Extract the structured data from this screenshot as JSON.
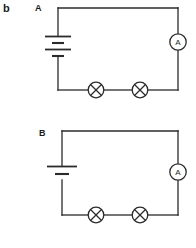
{
  "figure": {
    "panel_letter": "b",
    "width": 196,
    "height": 248,
    "background_color": "#ffffff",
    "stroke_color": "#2b2b2b"
  },
  "circuits": [
    {
      "id": "circuit-a",
      "label": "A",
      "battery": {
        "type": "battery",
        "cells": 2,
        "position": "left-branch"
      },
      "ammeter": {
        "type": "ammeter",
        "symbol": "A",
        "position": "right-branch"
      },
      "lamps": [
        {
          "type": "lamp",
          "symbol": "crossed-circle",
          "position": "bottom-left"
        },
        {
          "type": "lamp",
          "symbol": "crossed-circle",
          "position": "bottom-right"
        }
      ]
    },
    {
      "id": "circuit-b",
      "label": "B",
      "battery": {
        "type": "cell",
        "cells": 1,
        "position": "left-branch"
      },
      "ammeter": {
        "type": "ammeter",
        "symbol": "A",
        "position": "right-branch"
      },
      "lamps": [
        {
          "type": "lamp",
          "symbol": "crossed-circle",
          "position": "bottom-left"
        },
        {
          "type": "lamp",
          "symbol": "crossed-circle",
          "position": "bottom-right"
        }
      ]
    }
  ]
}
